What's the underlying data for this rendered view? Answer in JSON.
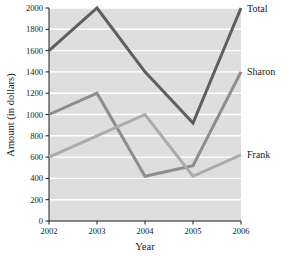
{
  "chart_data": {
    "type": "line",
    "title": "",
    "xlabel": "Year",
    "ylabel": "Amount (in dollars)",
    "categories": [
      "2002",
      "2003",
      "2004",
      "2005",
      "2006"
    ],
    "x": [
      2002,
      2003,
      2004,
      2005,
      2006
    ],
    "xlim": [
      2002,
      2006
    ],
    "ylim": [
      0,
      2000
    ],
    "yticks": [
      0,
      200,
      400,
      600,
      800,
      1000,
      1200,
      1400,
      1600,
      1800,
      2000
    ],
    "ytick_labels": [
      "0",
      "200",
      "400",
      "600",
      "800",
      "1000",
      "1200",
      "1400",
      "1600",
      "1800",
      "2000"
    ],
    "grid": "horizontal",
    "legend_position": "right-inline",
    "plot_background": "#dedede",
    "gridline_color": "#ffffff",
    "series": [
      {
        "name": "Total",
        "color": "#5e5e5e",
        "values": [
          1600,
          2000,
          1400,
          920,
          2000
        ]
      },
      {
        "name": "Sharon",
        "color": "#8d8d8d",
        "values": [
          1000,
          1200,
          420,
          520,
          1400
        ]
      },
      {
        "name": "Frank",
        "color": "#ababab",
        "values": [
          600,
          800,
          1000,
          420,
          620
        ]
      }
    ]
  },
  "axes": {
    "y_title": "Amount (in dollars)",
    "x_title": "Year",
    "y_ticks": [
      "2000",
      "1800",
      "1600",
      "1400",
      "1200",
      "1000",
      "800",
      "600",
      "400",
      "200",
      "0"
    ],
    "x_ticks": [
      "2002",
      "2003",
      "2004",
      "2005",
      "2006"
    ]
  },
  "series_labels": {
    "total": "Total",
    "sharon": "Sharon",
    "frank": "Frank"
  }
}
